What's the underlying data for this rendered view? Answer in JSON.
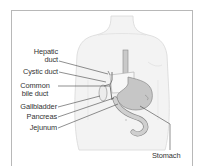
{
  "diagram": {
    "type": "anatomical-illustration",
    "labels": [
      {
        "id": "hepatic-duct",
        "lines": [
          "Hepatic",
          "duct"
        ]
      },
      {
        "id": "cystic-duct",
        "lines": [
          "Cystic duct"
        ]
      },
      {
        "id": "common-bile-duct",
        "lines": [
          "Common",
          "bile duct"
        ]
      },
      {
        "id": "gallbladder",
        "lines": [
          "Gallbladder"
        ]
      },
      {
        "id": "pancreas",
        "lines": [
          "Pancreas"
        ]
      },
      {
        "id": "jejunum",
        "lines": [
          "Jejunum"
        ]
      },
      {
        "id": "stomach",
        "lines": [
          "Stomach"
        ]
      }
    ],
    "colors": {
      "frame": "#b8b8b8",
      "body_fill": "#f2f2f2",
      "body_outline": "#d6d6d6",
      "organ_fill": "#c9c9c9",
      "organ_outline": "#8a8a8a",
      "leader_line": "#444444",
      "text": "#333333"
    }
  }
}
